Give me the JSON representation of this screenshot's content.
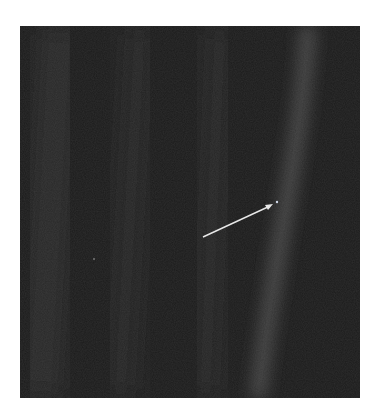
{
  "image": {
    "subject": "dark starfield image with faint diagonal light streaks and an arrow pointing to a tiny bright dot",
    "background_color": "#1a1a1a",
    "page_background": "#ffffff",
    "streak_color": "#5a5a5a",
    "arrow_color": "#e8e8e8",
    "arrow": {
      "from": [
        203,
        237
      ],
      "to": [
        272,
        204
      ]
    },
    "dot": {
      "x": 277,
      "y": 202
    },
    "faint_dot": {
      "x": 94,
      "y": 259
    }
  }
}
